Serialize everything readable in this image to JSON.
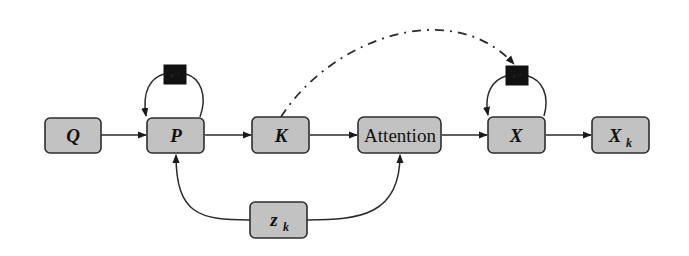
{
  "diagram": {
    "nodes": {
      "q": {
        "label": "Q"
      },
      "p": {
        "label": "P"
      },
      "k": {
        "label": "K"
      },
      "attention": {
        "label": "Attention"
      },
      "x": {
        "label": "X"
      },
      "xk": {
        "label": "X",
        "subscript": "k"
      },
      "zk": {
        "label": "z",
        "subscript": "k"
      }
    },
    "delays": {
      "p_delay": {
        "label": "z⁻¹"
      },
      "x_delay": {
        "label": "z⁻¹"
      }
    },
    "edges": [
      {
        "from": "Q",
        "to": "P",
        "style": "solid"
      },
      {
        "from": "P",
        "to": "K",
        "style": "solid"
      },
      {
        "from": "K",
        "to": "Attention",
        "style": "solid"
      },
      {
        "from": "Attention",
        "to": "X",
        "style": "solid"
      },
      {
        "from": "X",
        "to": "X_k",
        "style": "solid"
      },
      {
        "from": "P",
        "to": "P",
        "via": "delay",
        "style": "solid"
      },
      {
        "from": "X",
        "to": "X",
        "via": "delay",
        "style": "solid"
      },
      {
        "from": "z_k",
        "to": "P",
        "style": "solid"
      },
      {
        "from": "z_k",
        "to": "Attention",
        "style": "solid"
      },
      {
        "from": "K",
        "to": "X delay",
        "style": "dash-dot"
      }
    ],
    "colors": {
      "node_fill": "#c2c2c2",
      "node_stroke": "#2e2e2e",
      "delay_fill": "#111111",
      "edge": "#2b2b2b"
    }
  }
}
